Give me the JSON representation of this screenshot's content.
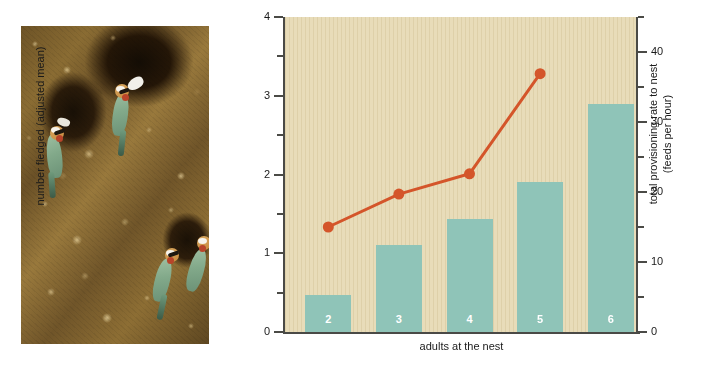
{
  "figure": {
    "photo": {
      "caption_alt": "white-fronted bee-eaters at nest burrows in a sandy cliff",
      "bird_count": 4
    }
  },
  "chart_data": {
    "type": "bar",
    "title": "",
    "xlabel": "adults at the nest",
    "ylabel": "number fledged (adjusted mean)",
    "ylabel_right": "total provisioning rate to nest (feeds per hour)",
    "categories": [
      "2",
      "3",
      "4",
      "5",
      "6"
    ],
    "grid": false,
    "legend": "none",
    "ylim": [
      0,
      4
    ],
    "ylim_right": [
      0,
      45
    ],
    "yticks": [
      "0",
      "1",
      "2",
      "3",
      "4"
    ],
    "ytick_values": [
      0,
      1,
      2,
      3,
      4
    ],
    "yminor_values": [
      0.5,
      1.5,
      2.5,
      3.5
    ],
    "yticks_right": [
      "0",
      "10",
      "20",
      "30",
      "40"
    ],
    "ytick_values_right": [
      0,
      10,
      20,
      30,
      40
    ],
    "yminor_values_right": [
      5,
      15,
      25,
      35,
      45
    ],
    "series": [
      {
        "name": "number fledged (adjusted mean)",
        "type": "bar",
        "axis": "left",
        "color": "#8fc4b8",
        "values": [
          0.47,
          1.1,
          1.43,
          1.9,
          2.9
        ]
      },
      {
        "name": "total provisioning rate to nest (feeds per hour)",
        "type": "line",
        "axis": "right",
        "color": "#d4552a",
        "values": [
          15.0,
          19.7,
          22.6,
          36.9,
          null
        ],
        "points_x": [
          "2",
          "3",
          "4",
          "5"
        ]
      }
    ]
  },
  "colors": {
    "bar": "#8fc4b8",
    "line": "#d4552a",
    "plot_background": "#e8dcb9",
    "axis": "#4a4a46",
    "bar_label_text": "#ffffff",
    "page_background": "#ffffff"
  }
}
